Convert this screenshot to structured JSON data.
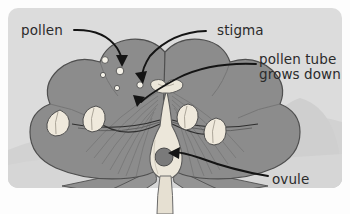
{
  "figure": {
    "panel": {
      "background_color": "#dcdcdc",
      "outer_background_color": "#fdfdfd",
      "corner_radius_px": 10
    },
    "palette": {
      "petal": "#8c8c8c",
      "petal_shadow": "#7d7d7d",
      "petal_outline": "#4f4f4f",
      "pistil_cream": "#ece7da",
      "anther_cream": "#efe9dc",
      "ovule_gray": "#7a7a7a",
      "pollen_grain": "#f2efe6",
      "stem_cream": "#e6e0d2",
      "sepal": "#8f8f8f",
      "hill_background": "#cfcfcf",
      "arrow": "#1a1a1a",
      "text": "#2b2b2b"
    }
  },
  "labels": {
    "pollen": {
      "text": "pollen"
    },
    "stigma": {
      "text": "stigma"
    },
    "pollen_tube": {
      "line1": "pollen tube",
      "line2": "grows down"
    },
    "ovule": {
      "text": "ovule"
    }
  },
  "annotations": [
    {
      "name": "pollen-pointer",
      "label": "pollen",
      "points_to": "pollen-grains"
    },
    {
      "name": "stigma-pointer",
      "label": "stigma",
      "points_to": "stigma"
    },
    {
      "name": "pollen-tube-pointer",
      "label": "pollen tube grows down",
      "points_to": "style"
    },
    {
      "name": "ovule-pointer",
      "label": "ovule",
      "points_to": "ovule"
    }
  ],
  "parts": [
    {
      "name": "petals",
      "count": 5,
      "color": "#8c8c8c"
    },
    {
      "name": "pollen-grains",
      "count": 5,
      "color": "#f2efe6"
    },
    {
      "name": "stigma",
      "count": 1,
      "color": "#ece7da"
    },
    {
      "name": "style",
      "count": 1,
      "color": "#ece7da"
    },
    {
      "name": "ovary",
      "count": 1,
      "color": "#ece7da"
    },
    {
      "name": "ovule",
      "count": 1,
      "color": "#7a7a7a"
    },
    {
      "name": "anthers",
      "count": 4,
      "color": "#efe9dc"
    },
    {
      "name": "filaments",
      "count": 4,
      "color": "#3a3a3a"
    },
    {
      "name": "sepals",
      "count": 2,
      "color": "#8f8f8f"
    },
    {
      "name": "stem",
      "count": 1,
      "color": "#e6e0d2"
    }
  ]
}
